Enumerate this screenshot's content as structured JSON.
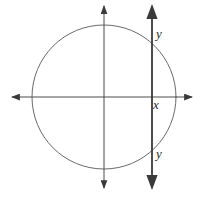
{
  "figure": {
    "background": "#ffffff",
    "width": 200,
    "height": 202,
    "line_color": "#3a3a3a",
    "axes": {
      "color": "#4a4a4a",
      "stroke_width": 1,
      "x_axis": {
        "x1": 12,
        "y1": 97,
        "x2": 192,
        "y2": 97
      },
      "y_axis": {
        "x1": 104,
        "y1": 6,
        "x2": 104,
        "y2": 188
      }
    },
    "circle": {
      "cx": 104,
      "cy": 97,
      "r": 72,
      "color": "#6a6a6a",
      "stroke_width": 1
    },
    "secant_line": {
      "x1": 152,
      "y1": 6,
      "x2": 152,
      "y2": 188,
      "color": "#2e2e2e",
      "stroke_width": 1.7
    },
    "labels": {
      "top_intersection": {
        "text": "y",
        "x": 156,
        "y": 38
      },
      "axis_intersection": {
        "text": "x",
        "x": 153,
        "y": 109
      },
      "bottom_intersection": {
        "text": "y",
        "x": 156,
        "y": 158
      }
    }
  }
}
